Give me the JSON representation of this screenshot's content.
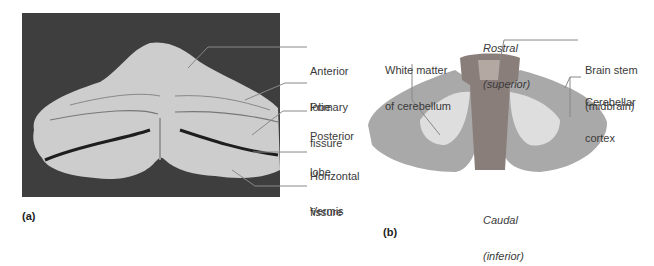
{
  "panel_a": {
    "panel_label": "(a)",
    "labels": [
      {
        "id": "anterior-lobe",
        "line1": "Anterior",
        "line2": "lobe"
      },
      {
        "id": "primary-fissure",
        "line1": "Primary",
        "line2": "fissure"
      },
      {
        "id": "posterior-lobe",
        "line1": "Posterior",
        "line2": "lobe"
      },
      {
        "id": "horizontal-fissure",
        "line1": "Horizontal",
        "line2": "fissure"
      },
      {
        "id": "vermis",
        "line1": "Vermis",
        "line2": ""
      }
    ],
    "colors": {
      "background": "#3c3c3c",
      "tissue": "#c9c9c9"
    }
  },
  "panel_b": {
    "panel_label": "(b)",
    "top_label": {
      "line1": "Rostral",
      "line2": "(superior)"
    },
    "bottom_label": {
      "line1": "Caudal",
      "line2": "(inferior)"
    },
    "labels": [
      {
        "id": "white-matter",
        "line1": "White matter",
        "line2": "of cerebellum"
      },
      {
        "id": "brain-stem",
        "line1": "Brain stem",
        "line2": "(midbrain)"
      },
      {
        "id": "cerebellar-cortex",
        "line1": "Cerebellar",
        "line2": "cortex"
      }
    ]
  }
}
